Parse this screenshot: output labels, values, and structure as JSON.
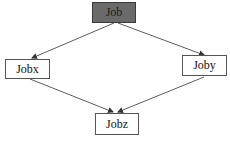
{
  "diagram": {
    "type": "directed-graph",
    "nodes": [
      {
        "id": "job",
        "label": "Job",
        "fill": "#6a6a6a"
      },
      {
        "id": "jobx",
        "label": "Jobx",
        "fill": "#ffffff"
      },
      {
        "id": "joby",
        "label": "Joby",
        "fill": "#ffffff"
      },
      {
        "id": "jobz",
        "label": "Jobz",
        "fill": "#ffffff"
      }
    ],
    "edges": [
      {
        "from": "Job",
        "to": "Jobx"
      },
      {
        "from": "Job",
        "to": "Joby"
      },
      {
        "from": "Jobx",
        "to": "Jobz"
      },
      {
        "from": "Joby",
        "to": "Jobz"
      }
    ]
  }
}
